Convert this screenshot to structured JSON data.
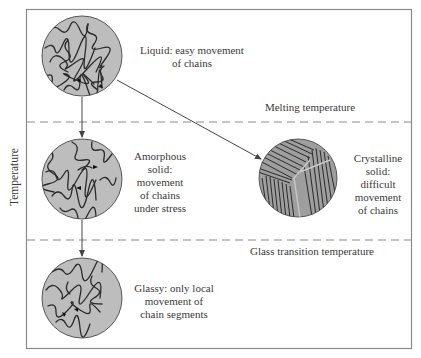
{
  "figure": {
    "y_axis_label": "Temperature",
    "thresholds": [
      {
        "label": "Melting temperature"
      },
      {
        "label": "Glass transition temperature"
      }
    ],
    "states": [
      {
        "name": "liquid",
        "description_lines": [
          "Liquid: easy movement",
          "of chains"
        ],
        "structure": "tangled-chains"
      },
      {
        "name": "amorphous-solid",
        "description_lines": [
          "Amorphous",
          "solid:",
          "movement",
          "of chains",
          "under stress"
        ],
        "structure": "tangled-chains"
      },
      {
        "name": "crystalline-solid",
        "description_lines": [
          "Crystalline",
          "solid:",
          "difficult",
          "movement",
          "of chains"
        ],
        "structure": "aligned-lamellae"
      },
      {
        "name": "glassy",
        "description_lines": [
          "Glassy: only local",
          "movement of",
          "chain segments"
        ],
        "structure": "tangled-chains"
      }
    ],
    "transitions": [
      {
        "from": "liquid",
        "to": "amorphous-solid"
      },
      {
        "from": "amorphous-solid",
        "to": "glassy"
      },
      {
        "from": "liquid",
        "to": "crystalline-solid"
      }
    ],
    "colors": {
      "frame": "#8a8a8a",
      "circle_fill": "#bdbdbd",
      "circle_stroke": "#555555",
      "chain": "#2a2a2a",
      "dash": "#8a8a8a",
      "arrow": "#444444"
    }
  }
}
